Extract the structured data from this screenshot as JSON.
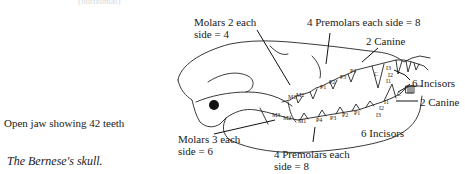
{
  "header": {
    "cutoff_text": "(horizontal)"
  },
  "captions": {
    "open_jaw": "Open jaw showing 42 teeth",
    "title": "The Bernese's skull."
  },
  "labels": {
    "upper_molars": [
      "Molars 2 each",
      "side = 4"
    ],
    "upper_premolars": "4 Premolars each side = 8",
    "upper_canine": "2 Canine",
    "incisors_right": "6 Incisors",
    "lower_canine": "2 Canine",
    "lower_molars": [
      "Molars 3 each",
      "side = 6"
    ],
    "lower_premolars": [
      "4 Premolars each",
      "side = 8"
    ],
    "lower_incisors": "6 Incisors"
  },
  "tooth_marks": {
    "upper": [
      "M1",
      "M2",
      "P4",
      "P3",
      "P2",
      "P1",
      "C",
      "I3",
      "I2",
      "I1"
    ],
    "lower": [
      "M3",
      "M2",
      "M1",
      "P4",
      "P3",
      "P2",
      "P1",
      "C",
      "I1",
      "I2",
      "I3"
    ]
  }
}
